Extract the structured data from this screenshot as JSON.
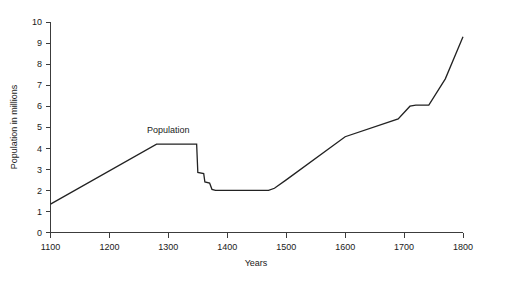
{
  "chart_data": {
    "type": "line",
    "title": "",
    "xlabel": "Years",
    "ylabel": "Population in millions",
    "xlim": [
      1100,
      1800
    ],
    "ylim": [
      0,
      10
    ],
    "grid": false,
    "legend": "none",
    "xticks": [
      1100,
      1200,
      1300,
      1400,
      1500,
      1600,
      1700,
      1800
    ],
    "xtick_labels": [
      "1100",
      "1200",
      "1300",
      "1400",
      "1500",
      "1600",
      "1700",
      "1800"
    ],
    "yticks": [
      0,
      1,
      2,
      3,
      4,
      5,
      6,
      7,
      8,
      9,
      10
    ],
    "ytick_labels": [
      "0",
      "1",
      "2",
      "3",
      "4",
      "5",
      "6",
      "7",
      "8",
      "9",
      "10"
    ],
    "series": [
      {
        "name": "Population",
        "color": "#222222",
        "x": [
          1100,
          1280,
          1348,
          1350,
          1360,
          1362,
          1370,
          1374,
          1380,
          1400,
          1470,
          1480,
          1500,
          1600,
          1690,
          1710,
          1720,
          1742,
          1770,
          1800
        ],
        "values": [
          1.35,
          4.2,
          4.2,
          2.85,
          2.8,
          2.4,
          2.35,
          2.05,
          2.0,
          2.0,
          2.0,
          2.1,
          2.5,
          4.55,
          5.4,
          6.0,
          6.05,
          6.05,
          7.3,
          9.3
        ]
      }
    ],
    "annotations": [
      {
        "text": "Population",
        "x": 1300,
        "y": 4.75
      }
    ]
  },
  "figure": {
    "background": "#ffffff",
    "axis_color": "#3c3c3c",
    "text_color": "#1a1a1a"
  }
}
